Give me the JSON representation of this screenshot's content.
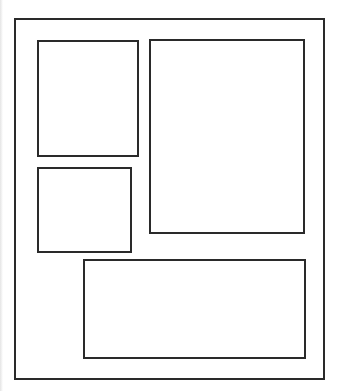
{
  "diagram": {
    "type": "layout-wireframe",
    "stroke_color": "#2a2a2a",
    "background_color": "#ffffff",
    "outer_frame": {
      "x": 14,
      "y": 18,
      "width": 311,
      "height": 362
    },
    "panels": [
      {
        "id": "top-left-panel",
        "x": 37,
        "y": 40,
        "width": 102,
        "height": 117
      },
      {
        "id": "right-tall-panel",
        "x": 149,
        "y": 39,
        "width": 156,
        "height": 195
      },
      {
        "id": "middle-left-panel",
        "x": 37,
        "y": 167,
        "width": 95,
        "height": 86
      },
      {
        "id": "bottom-wide-panel",
        "x": 83,
        "y": 259,
        "width": 223,
        "height": 100
      }
    ]
  }
}
